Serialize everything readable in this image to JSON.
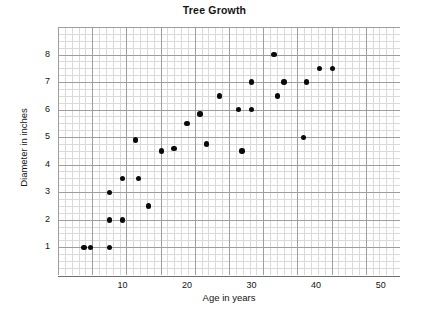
{
  "chart_data": {
    "type": "scatter",
    "title": "Tree Growth",
    "xlabel": "Age in years",
    "ylabel": "Diameter in inches",
    "xlim": [
      0,
      53
    ],
    "ylim": [
      0,
      9
    ],
    "xticks": [
      10,
      20,
      30,
      40,
      50
    ],
    "yticks": [
      1,
      2,
      3,
      4,
      5,
      6,
      7,
      8
    ],
    "grid": true,
    "legend": null,
    "series": [
      {
        "name": "trees",
        "points": [
          {
            "x": 4,
            "y": 1
          },
          {
            "x": 5,
            "y": 1
          },
          {
            "x": 8,
            "y": 1
          },
          {
            "x": 8,
            "y": 2
          },
          {
            "x": 10,
            "y": 2
          },
          {
            "x": 8,
            "y": 3
          },
          {
            "x": 10,
            "y": 3.5
          },
          {
            "x": 12.5,
            "y": 3.5
          },
          {
            "x": 14,
            "y": 2.5
          },
          {
            "x": 12,
            "y": 4.9
          },
          {
            "x": 16,
            "y": 4.5
          },
          {
            "x": 18,
            "y": 4.6
          },
          {
            "x": 20,
            "y": 5.5
          },
          {
            "x": 22,
            "y": 5.85
          },
          {
            "x": 23,
            "y": 4.75
          },
          {
            "x": 25,
            "y": 6.5
          },
          {
            "x": 28,
            "y": 6
          },
          {
            "x": 28.5,
            "y": 4.5
          },
          {
            "x": 30,
            "y": 6
          },
          {
            "x": 30,
            "y": 7
          },
          {
            "x": 33.5,
            "y": 8
          },
          {
            "x": 34,
            "y": 6.5
          },
          {
            "x": 35,
            "y": 7
          },
          {
            "x": 38,
            "y": 5
          },
          {
            "x": 38.5,
            "y": 7
          },
          {
            "x": 40.5,
            "y": 7.5
          },
          {
            "x": 42.5,
            "y": 7.5
          }
        ]
      }
    ]
  },
  "chart": {
    "title": "Tree Growth",
    "x_axis_title": "Age in years",
    "y_axis_title": "Diameter in inches",
    "x_tick_labels": [
      "10",
      "20",
      "30",
      "40",
      "50"
    ],
    "y_tick_labels": [
      "8",
      "7",
      "6",
      "5",
      "4",
      "3",
      "2",
      "1"
    ],
    "colors": {
      "marker": "#0a0a0a",
      "grid_minor": "#bdbdbd",
      "grid_major": "#8a8a8a",
      "axis": "#6f6f6f",
      "background": "#ffffff",
      "text": "#141414"
    }
  }
}
